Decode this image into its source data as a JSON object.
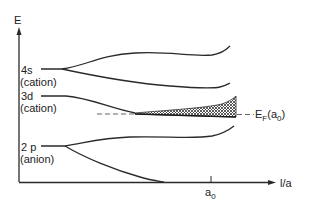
{
  "axes": {
    "y_label": "E",
    "x_label": "l/a",
    "x_tick_label": "a",
    "x_tick_sub": "0"
  },
  "levels": [
    {
      "name": "4s",
      "sublabel": "(cation)"
    },
    {
      "name": "3d",
      "sublabel": "(cation)"
    },
    {
      "name": "2 p",
      "sublabel": "(anion)"
    }
  ],
  "fermi": {
    "label_main": "E",
    "label_sub": "F",
    "label_paren_open": "(a",
    "label_paren_sub": "0",
    "label_paren_close": ")"
  },
  "colors": {
    "line": "#2a2a2a",
    "hatch": "#333333",
    "background": "#ffffff"
  }
}
